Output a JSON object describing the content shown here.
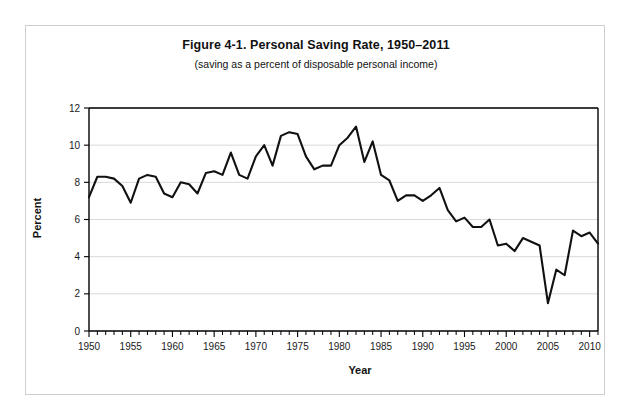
{
  "figure": {
    "title": "Figure 4-1. Personal Saving Rate, 1950–2011",
    "subtitle": "(saving as a percent of disposable personal income)"
  },
  "chart_data": {
    "type": "line",
    "title": "Figure 4-1. Personal Saving Rate, 1950–2011",
    "subtitle": "(saving as a percent of disposable personal income)",
    "xlabel": "Year",
    "ylabel": "Percent",
    "xlim": [
      1950,
      2011
    ],
    "ylim": [
      0,
      12
    ],
    "ytick_step": 2,
    "xtick_step": 5,
    "minor_xtick_step": 1,
    "grid": "horizontal",
    "legend": "none",
    "line_color": "#111111",
    "series": [
      {
        "name": "Personal saving rate",
        "x": [
          1950,
          1951,
          1952,
          1953,
          1954,
          1955,
          1956,
          1957,
          1958,
          1959,
          1960,
          1961,
          1962,
          1963,
          1964,
          1965,
          1966,
          1967,
          1968,
          1969,
          1970,
          1971,
          1972,
          1973,
          1974,
          1975,
          1976,
          1977,
          1978,
          1979,
          1980,
          1981,
          1982,
          1983,
          1984,
          1985,
          1986,
          1987,
          1988,
          1989,
          1990,
          1991,
          1992,
          1993,
          1994,
          1995,
          1996,
          1997,
          1998,
          1999,
          2000,
          2001,
          2002,
          2003,
          2004,
          2005,
          2006,
          2007,
          2008,
          2009,
          2010,
          2011
        ],
        "values": [
          7.2,
          8.3,
          8.3,
          8.2,
          7.8,
          6.9,
          8.2,
          8.4,
          8.3,
          7.4,
          7.2,
          8.0,
          7.9,
          7.4,
          8.5,
          8.6,
          8.4,
          9.6,
          8.4,
          8.2,
          9.4,
          10.0,
          8.9,
          10.5,
          10.7,
          10.6,
          9.4,
          8.7,
          8.9,
          8.9,
          10.0,
          10.4,
          11.0,
          9.1,
          10.2,
          8.4,
          8.1,
          7.0,
          7.3,
          7.3,
          7.0,
          7.3,
          7.7,
          6.5,
          5.9,
          6.1,
          5.6,
          5.6,
          6.0,
          4.6,
          4.7,
          4.3,
          5.0,
          4.8,
          4.6,
          1.5,
          3.3,
          3.0,
          5.4,
          5.1,
          5.3,
          4.7
        ]
      }
    ],
    "xtick_labels": [
      1950,
      1955,
      1960,
      1965,
      1970,
      1975,
      1980,
      1985,
      1990,
      1995,
      2000,
      2005,
      2010
    ],
    "ytick_labels": [
      0,
      2,
      4,
      6,
      8,
      10,
      12
    ]
  }
}
